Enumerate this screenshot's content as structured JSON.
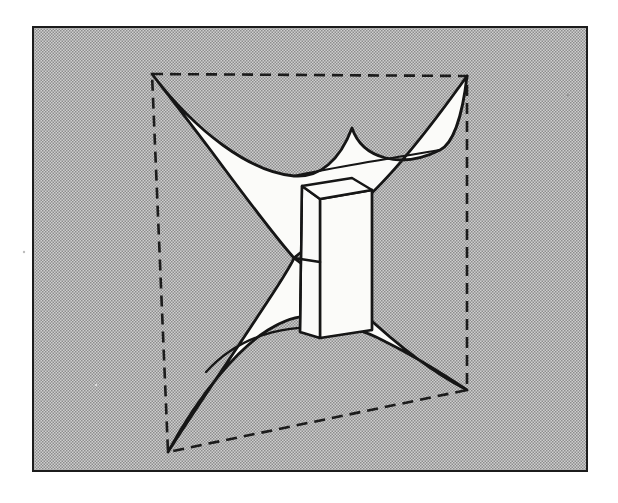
{
  "figure": {
    "title": "Geometric surface diagram",
    "canvas": {
      "width": 618,
      "height": 503
    },
    "background_color": "#ffffff",
    "panel": {
      "name": "shaded-panel",
      "x": 33,
      "y": 27,
      "width": 554,
      "height": 444,
      "fill_color": "#b9b9b9",
      "halftone": true,
      "halftone_cell_px": 3,
      "border_color": "#1a1a1a",
      "border_width": 2
    },
    "dashed_quad": {
      "name": "dashed-bounding-quadrilateral",
      "stroke_color": "#1a1a1a",
      "stroke_width": 2.6,
      "dash_pattern": "11,7",
      "points": [
        {
          "label": "top-left",
          "x": 152,
          "y": 74
        },
        {
          "label": "top-right",
          "x": 467,
          "y": 76
        },
        {
          "label": "bottom-right",
          "x": 467,
          "y": 390
        },
        {
          "label": "bottom-left",
          "x": 168,
          "y": 452
        }
      ]
    },
    "star_region": {
      "name": "white-cusp-star",
      "fill_color": "#fbfbf9",
      "stroke_color": "#141414",
      "stroke_width": 2.8,
      "waist_point": {
        "x": 294,
        "y": 258
      },
      "cusp_upper": {
        "x": 352,
        "y": 128
      },
      "cusp_lower": {
        "x": 338,
        "y": 331
      },
      "arm_tips": [
        {
          "label": "upper-left-tip",
          "x": 152,
          "y": 74
        },
        {
          "label": "upper-right-tip",
          "x": 467,
          "y": 76
        },
        {
          "label": "lower-right-tip",
          "x": 467,
          "y": 390
        },
        {
          "label": "lower-left-tip",
          "x": 168,
          "y": 452
        }
      ]
    },
    "prism": {
      "name": "central-rectangular-prism",
      "fill_color": "#fbfbf9",
      "stroke_color": "#141414",
      "stroke_width": 2.4,
      "top_face": [
        {
          "x": 302,
          "y": 186
        },
        {
          "x": 352,
          "y": 178
        },
        {
          "x": 372,
          "y": 190
        },
        {
          "x": 320,
          "y": 199
        }
      ],
      "front_face": [
        {
          "x": 302,
          "y": 186
        },
        {
          "x": 320,
          "y": 199
        },
        {
          "x": 320,
          "y": 338
        },
        {
          "x": 300,
          "y": 332
        }
      ],
      "side_face": [
        {
          "x": 320,
          "y": 199
        },
        {
          "x": 372,
          "y": 190
        },
        {
          "x": 372,
          "y": 330
        },
        {
          "x": 320,
          "y": 338
        }
      ]
    },
    "smudges": [
      {
        "name": "scan-speck-right",
        "x": 568,
        "y": 95,
        "r": 1.4
      },
      {
        "name": "scan-speck-upper-right",
        "x": 580,
        "y": 170,
        "r": 1.2
      },
      {
        "name": "scan-speck-left",
        "x": 24,
        "y": 252,
        "r": 1.2
      },
      {
        "name": "scan-speck-mid",
        "x": 96,
        "y": 385,
        "r": 1.1
      }
    ]
  }
}
